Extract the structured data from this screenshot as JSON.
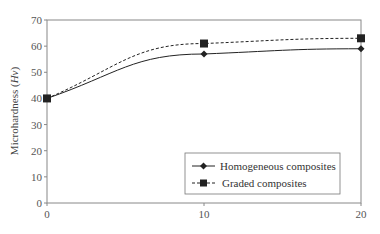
{
  "chart_data": {
    "type": "line",
    "title": "",
    "xlabel": "",
    "ylabel": "Microhardness (Hv)",
    "ylabel_main": "Microhardness (",
    "ylabel_italic": "Hv",
    "ylabel_close": ")",
    "xlim": [
      0,
      20
    ],
    "ylim": [
      0,
      70
    ],
    "x_ticks": [
      "0",
      "10",
      "20"
    ],
    "y_ticks": [
      "0",
      "10",
      "20",
      "30",
      "40",
      "50",
      "60",
      "70"
    ],
    "grid": false,
    "legend_position": "lower right",
    "x": [
      0,
      10,
      20
    ],
    "series": [
      {
        "name": "Homogeneous composites",
        "values": [
          40,
          57,
          59
        ],
        "marker": "diamond",
        "line": "solid",
        "color": "#222222"
      },
      {
        "name": "Graded composites",
        "values": [
          40,
          61,
          63
        ],
        "marker": "square",
        "line": "dashed",
        "color": "#222222"
      }
    ]
  },
  "legend": {
    "items": [
      {
        "label": "Homogeneous composites"
      },
      {
        "label": "Graded composites"
      }
    ]
  }
}
